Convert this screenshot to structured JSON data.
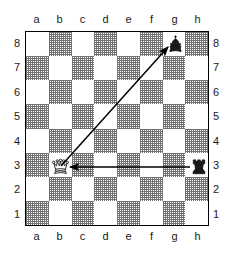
{
  "diagram": {
    "type": "chess-board-diagram",
    "orientation": "white-bottom",
    "board_size": 8,
    "colors": {
      "light_square": "#ffffff",
      "dark_square": "#8c8c8c",
      "border": "#000000",
      "label": "#1a1a1a",
      "arrow": "#000000",
      "black_piece": "#1a1a1a",
      "white_piece": "#ffffff"
    },
    "files": [
      "a",
      "b",
      "c",
      "d",
      "e",
      "f",
      "g",
      "h"
    ],
    "ranks": [
      "8",
      "7",
      "6",
      "5",
      "4",
      "3",
      "2",
      "1"
    ],
    "file_labels_top": [
      "a",
      "b",
      "c",
      "d",
      "e",
      "f",
      "g",
      "h"
    ],
    "file_labels_bottom": [
      "a",
      "b",
      "c",
      "d",
      "e",
      "f",
      "g",
      "h"
    ],
    "rank_labels_left": [
      "8",
      "7",
      "6",
      "5",
      "4",
      "3",
      "2",
      "1"
    ],
    "rank_labels_right": [
      "8",
      "7",
      "6",
      "5",
      "4",
      "3",
      "2",
      "1"
    ],
    "pieces": [
      {
        "id": "black-king",
        "piece": "king",
        "color": "black",
        "glyph": "♚",
        "square": "g8",
        "file": "g",
        "rank": "8",
        "file_index": 6,
        "rank_index": 0
      },
      {
        "id": "white-queen",
        "piece": "queen",
        "color": "white",
        "glyph": "♕",
        "square": "b3",
        "file": "b",
        "rank": "3",
        "file_index": 1,
        "rank_index": 5
      },
      {
        "id": "black-rook",
        "piece": "rook",
        "color": "black",
        "glyph": "♜",
        "square": "h3",
        "file": "h",
        "rank": "3",
        "file_index": 7,
        "rank_index": 5
      }
    ],
    "arrows": [
      {
        "id": "arrow-queen-to-king",
        "from": "b3",
        "to": "g8",
        "label": "Qb3-g8 diagonal",
        "head": "to"
      },
      {
        "id": "arrow-rook-to-queen",
        "from": "h3",
        "to": "b3",
        "label": "Rh3-b3 rank",
        "head": "to"
      }
    ]
  }
}
